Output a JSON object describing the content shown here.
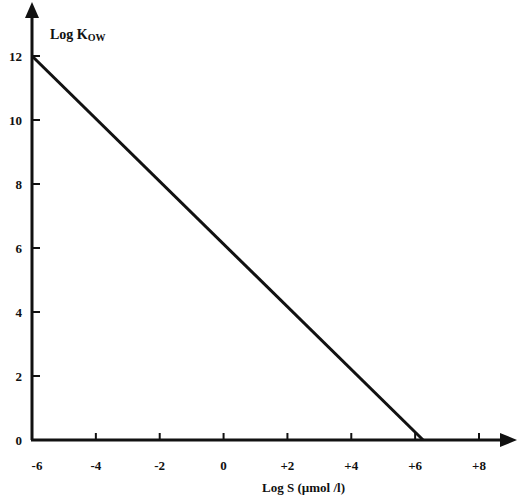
{
  "chart_data": {
    "type": "line",
    "title": "",
    "xlabel": "Log S  (µmol /l)",
    "ylabel": "Log K",
    "ylabel_subscript": "OW",
    "xlim": [
      -6,
      9
    ],
    "ylim": [
      0,
      13
    ],
    "x_ticks": [
      "-6",
      "-4",
      "-2",
      "0",
      "+2",
      "+4",
      "+6",
      "+8"
    ],
    "y_ticks": [
      "0",
      "2",
      "4",
      "6",
      "8",
      "10",
      "12"
    ],
    "grid": false,
    "legend": null,
    "series": [
      {
        "name": "Log Kow vs Log S",
        "x": [
          -6,
          6.25
        ],
        "y": [
          12,
          0
        ]
      }
    ]
  },
  "colors": {
    "axis": "#111111",
    "line": "#111111",
    "background": "#ffffff"
  }
}
